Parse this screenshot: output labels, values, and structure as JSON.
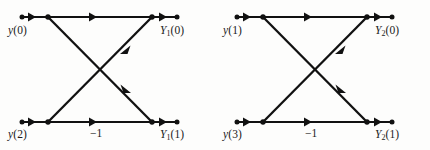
{
  "figure": {
    "type": "signal-flow-graph",
    "background_color": "#fdfdfc",
    "line_color": "#111111",
    "text_color": "#1a1a1a",
    "width": 430,
    "height": 150
  },
  "butterflies": [
    {
      "id": "butterfly-left",
      "origin_x": 0,
      "inputs": [
        {
          "id": "in-top",
          "symbol": "y",
          "index": "0",
          "label": "y (0)"
        },
        {
          "id": "in-bottom",
          "symbol": "y",
          "index": "2",
          "label": "y (2)"
        }
      ],
      "outputs": [
        {
          "id": "out-top",
          "symbol": "Y",
          "subscript": "1",
          "index": "0",
          "label": "Y1 (0)"
        },
        {
          "id": "out-bottom",
          "symbol": "Y",
          "subscript": "1",
          "index": "1",
          "label": "Y1 (1)"
        }
      ],
      "coefficient": {
        "id": "coef-bottom",
        "label": "−1",
        "value": -1
      }
    },
    {
      "id": "butterfly-right",
      "origin_x": 215,
      "inputs": [
        {
          "id": "in-top",
          "symbol": "y",
          "index": "1",
          "label": "y (1)"
        },
        {
          "id": "in-bottom",
          "symbol": "y",
          "index": "3",
          "label": "y (3)"
        }
      ],
      "outputs": [
        {
          "id": "out-top",
          "symbol": "Y",
          "subscript": "2",
          "index": "0",
          "label": "Y2 (0)"
        },
        {
          "id": "out-bottom",
          "symbol": "Y",
          "subscript": "2",
          "index": "1",
          "label": "Y2 (1)"
        }
      ],
      "coefficient": {
        "id": "coef-bottom",
        "label": "−1",
        "value": -1
      }
    }
  ],
  "labels": {
    "left_input_top": "y",
    "left_input_top_index": "(0)",
    "left_input_bottom": "y",
    "left_input_bottom_index": "(2)",
    "left_output_top": "Y",
    "left_output_top_sub": "1",
    "left_output_top_index": "(0)",
    "left_output_bottom": "Y",
    "left_output_bottom_sub": "1",
    "left_output_bottom_index": "(1)",
    "left_coefficient": "−1",
    "right_input_top": "y",
    "right_input_top_index": "(1)",
    "right_input_bottom": "y",
    "right_input_bottom_index": "(3)",
    "right_output_top": "Y",
    "right_output_top_sub": "2",
    "right_output_top_index": "(0)",
    "right_output_bottom": "Y",
    "right_output_bottom_sub": "2",
    "right_output_bottom_index": "(1)",
    "right_coefficient": "−1"
  }
}
